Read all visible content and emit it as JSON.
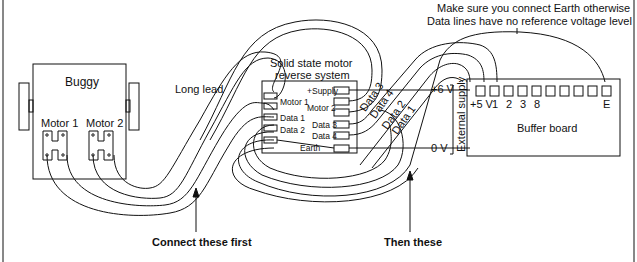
{
  "note": {
    "line1": "Make sure you connect Earth otherwise",
    "line2": "Data lines have no reference voltage level"
  },
  "buggy": {
    "title": "Buggy",
    "motor1": "Motor 1",
    "motor2": "Motor 2"
  },
  "lead": {
    "label": "Long lead"
  },
  "reverse_system": {
    "title_line1": "Solid state motor",
    "title_line2": "reverse system",
    "left_pins": [
      "Motor 1",
      "Data 1",
      "Data 2",
      "Earth"
    ],
    "right_pins": [
      "+Supply",
      "Motor 2",
      "Data 3",
      "Data 4"
    ]
  },
  "wires": {
    "data3": "Data 3",
    "data4": "Data 4",
    "data2": "Data 2",
    "data1": "Data 1"
  },
  "supply": {
    "plus6": "+6 V",
    "zero": "0 V",
    "label": "External supply"
  },
  "buffer_board": {
    "title": "Buffer board",
    "pins": [
      "+5 V",
      "1",
      "2",
      "3",
      "8",
      "E"
    ]
  },
  "callouts": {
    "first": "Connect these first",
    "then": "Then these"
  },
  "colors": {
    "ink": "#111111",
    "background": "#ffffff"
  }
}
